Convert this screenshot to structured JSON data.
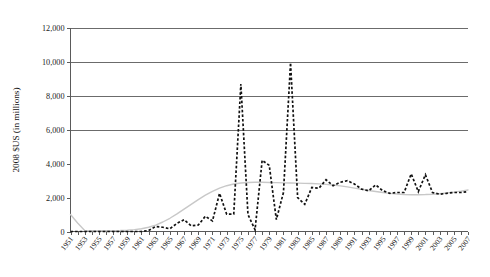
{
  "chart_data": {
    "type": "line",
    "title": "",
    "subtitle": "",
    "xlabel": "",
    "ylabel": "2008 $US (in millions)",
    "ylim": [
      0,
      12000
    ],
    "xlim": [
      1951,
      2007
    ],
    "grid": true,
    "gridlines_at": [
      6000,
      8000,
      10000,
      12000
    ],
    "legend_position": "none",
    "ytick_labels": [
      "0",
      "2,000",
      "4,000",
      "6,000",
      "8,000",
      "10,000",
      "12,000"
    ],
    "ytick_values": [
      0,
      2000,
      4000,
      6000,
      8000,
      10000,
      12000
    ],
    "xtick_labels": [
      "1951",
      "1953",
      "1955",
      "1957",
      "1959",
      "1961",
      "1963",
      "1965",
      "1967",
      "1969",
      "1971",
      "1973",
      "1975",
      "1977",
      "1979",
      "1981",
      "1983",
      "1985",
      "1987",
      "1989",
      "1991",
      "1993",
      "1995",
      "1997",
      "1999",
      "2001",
      "2003",
      "2005",
      "2007"
    ],
    "xtick_values": [
      1951,
      1953,
      1955,
      1957,
      1959,
      1961,
      1963,
      1965,
      1967,
      1969,
      1971,
      1973,
      1975,
      1977,
      1979,
      1981,
      1983,
      1985,
      1987,
      1989,
      1991,
      1993,
      1995,
      1997,
      1999,
      2001,
      2003,
      2005,
      2007
    ],
    "x": [
      1951,
      1952,
      1953,
      1954,
      1955,
      1956,
      1957,
      1958,
      1959,
      1960,
      1961,
      1962,
      1963,
      1964,
      1965,
      1966,
      1967,
      1968,
      1969,
      1970,
      1971,
      1972,
      1973,
      1974,
      1975,
      1976,
      1977,
      1978,
      1979,
      1980,
      1981,
      1982,
      1983,
      1984,
      1985,
      1986,
      1987,
      1988,
      1989,
      1990,
      1991,
      1992,
      1993,
      1994,
      1995,
      1996,
      1997,
      1998,
      1999,
      2000,
      2001,
      2002,
      2003,
      2004,
      2005,
      2006,
      2007
    ],
    "series": [
      {
        "name": "Annual value (dashed)",
        "style": "dashed",
        "color": "#111111",
        "values": [
          0,
          0,
          0,
          0,
          0,
          0,
          0,
          0,
          0,
          0,
          0,
          60,
          300,
          250,
          160,
          480,
          700,
          330,
          380,
          900,
          620,
          2250,
          1020,
          1030,
          8700,
          1000,
          100,
          4200,
          3900,
          700,
          2300,
          9950,
          2000,
          1600,
          2600,
          2550,
          3050,
          2700,
          2900,
          3000,
          2800,
          2500,
          2400,
          2750,
          2400,
          2250,
          2300,
          2300,
          3400,
          2350,
          3350,
          2300,
          2200,
          2250,
          2300,
          2300,
          2350
        ]
      },
      {
        "name": "Smoothed trend (gray)",
        "style": "solid",
        "color": "#c8c8c8",
        "values": [
          1000,
          500,
          60,
          40,
          40,
          40,
          50,
          60,
          80,
          110,
          160,
          250,
          380,
          560,
          780,
          1040,
          1320,
          1600,
          1880,
          2140,
          2370,
          2560,
          2700,
          2800,
          2860,
          2890,
          2900,
          2900,
          2890,
          2880,
          2870,
          2860,
          2850,
          2840,
          2830,
          2810,
          2780,
          2740,
          2690,
          2630,
          2560,
          2490,
          2420,
          2360,
          2300,
          2250,
          2210,
          2180,
          2170,
          2170,
          2180,
          2200,
          2230,
          2270,
          2320,
          2380,
          2450
        ]
      }
    ],
    "annotations": []
  },
  "colors": {
    "background": "#ffffff",
    "axis": "#5a5a5a",
    "gridline": "#6b6b6b",
    "actual_series": "#111111",
    "trend_series": "#c8c8c8",
    "text": "#111111"
  }
}
